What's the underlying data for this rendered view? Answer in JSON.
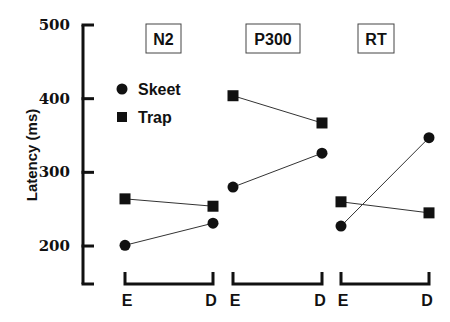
{
  "chart_data": {
    "type": "line",
    "title": "",
    "ylabel": "Latency (ms)",
    "xlabel": "",
    "ylim": [
      150,
      500
    ],
    "yticks": [
      200,
      300,
      400,
      500
    ],
    "grid": false,
    "legend": {
      "position": "upper-left (inside first panel)",
      "entries": [
        {
          "name": "Skeet",
          "marker": "circle"
        },
        {
          "name": "Trap",
          "marker": "square"
        }
      ]
    },
    "categories": [
      "E",
      "D"
    ],
    "panels": [
      {
        "label": "N2",
        "series": [
          {
            "name": "Skeet",
            "values": [
              201,
              231
            ]
          },
          {
            "name": "Trap",
            "values": [
              264,
              254
            ]
          }
        ]
      },
      {
        "label": "P300",
        "series": [
          {
            "name": "Skeet",
            "values": [
              280,
              326
            ]
          },
          {
            "name": "Trap",
            "values": [
              404,
              367
            ]
          }
        ]
      },
      {
        "label": "RT",
        "series": [
          {
            "name": "Skeet",
            "values": [
              227,
              347
            ]
          },
          {
            "name": "Trap",
            "values": [
              260,
              245
            ]
          }
        ]
      }
    ]
  },
  "colors": {
    "ink": "#111111",
    "line": "#333333",
    "background": "#ffffff"
  }
}
